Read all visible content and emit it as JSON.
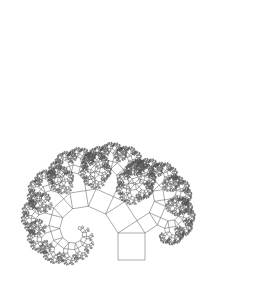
{
  "figure": {
    "type": "fractal",
    "background": "#ffffff",
    "stroke_color": "#555555",
    "stroke_width": 0.5,
    "base_square": {
      "x": 118,
      "y": 233,
      "size": 27
    },
    "branch_angle_deg": 33,
    "depth": 13
  }
}
